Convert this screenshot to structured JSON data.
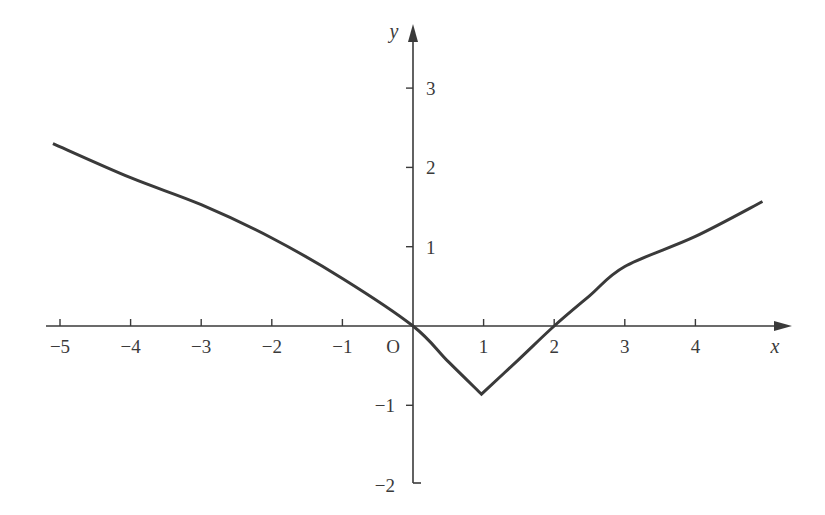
{
  "chart_data": {
    "type": "line",
    "title": "",
    "xlabel": "x",
    "ylabel": "y",
    "origin_label": "O",
    "xlim": [
      -5.3,
      5.3
    ],
    "ylim": [
      -2,
      3.6
    ],
    "x_ticks": [
      -5,
      -4,
      -3,
      -2,
      -1,
      1,
      2,
      3,
      4
    ],
    "x_tick_labels": [
      "−5",
      "−4",
      "−3",
      "−2",
      "−1",
      "1",
      "2",
      "3",
      "4"
    ],
    "y_ticks": [
      3,
      2,
      1,
      -1,
      -2
    ],
    "y_tick_labels": [
      "3",
      "2",
      "1",
      "−1",
      "−2"
    ],
    "grid": false,
    "legend": null,
    "series": [
      {
        "name": "curve",
        "color": "#3a3a3a",
        "x": [
          -5.1,
          -4,
          -3,
          -2,
          -1,
          0,
          0.5,
          0.97,
          1.5,
          2,
          2.5,
          3,
          4,
          4.95
        ],
        "y": [
          2.3,
          1.87,
          1.53,
          1.11,
          0.6,
          0,
          -0.45,
          -0.86,
          -0.42,
          0,
          0.38,
          0.75,
          1.13,
          1.57
        ]
      }
    ]
  },
  "colors": {
    "ink": "#3a3a3a",
    "background": "#ffffff"
  }
}
